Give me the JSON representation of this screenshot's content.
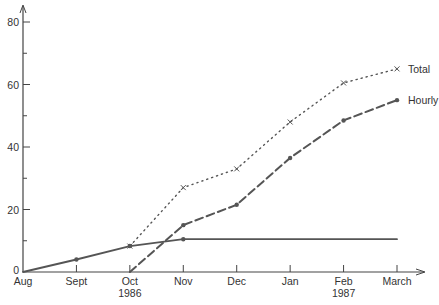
{
  "chart_data": {
    "type": "line",
    "title": "",
    "xlabel": "",
    "ylabel": "",
    "ylim": [
      0,
      80
    ],
    "grid": false,
    "legend_position": "inline-right",
    "categories": [
      "Aug",
      "Sept",
      "Oct",
      "Nov",
      "Dec",
      "Jan",
      "Feb",
      "March"
    ],
    "category_sublabels": [
      "",
      "",
      "1986",
      "",
      "",
      "",
      "1987",
      ""
    ],
    "y_ticks": [
      0,
      20,
      40,
      60,
      80
    ],
    "series": [
      {
        "name": "Total",
        "style": "dotted",
        "marker": "x",
        "values": [
          null,
          null,
          8.3,
          27,
          33,
          48,
          60.5,
          65
        ]
      },
      {
        "name": "Hourly",
        "style": "dashed",
        "marker": "dot",
        "values": [
          null,
          null,
          0,
          15,
          21.5,
          36.5,
          48.5,
          55
        ]
      },
      {
        "name": "",
        "style": "solid",
        "marker": "dot",
        "values": [
          0,
          4,
          8.3,
          10.5,
          10.5,
          10.5,
          10.5,
          10.5
        ]
      }
    ],
    "colors": {
      "line": "#555555",
      "axis": "#444444",
      "text": "#333333"
    }
  }
}
